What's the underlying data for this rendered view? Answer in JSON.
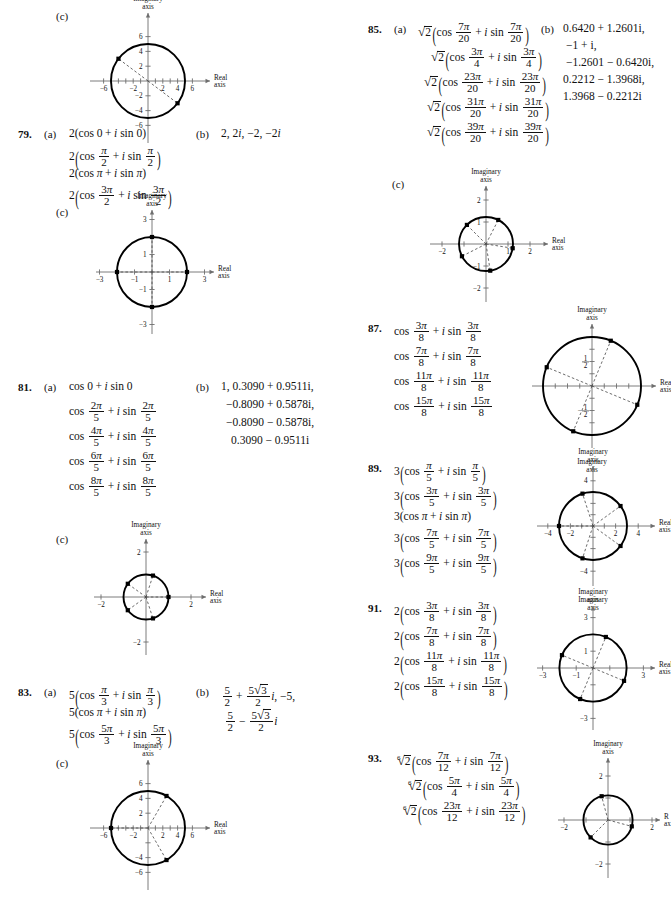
{
  "page": {
    "type": "textbook-answer-key",
    "axis_labels": {
      "imaginary": "Imaginary",
      "axis": "axis",
      "real": "Real",
      "real_clipped": "R",
      "axis_clipped": "ax"
    },
    "part_labels": {
      "a": "(a)",
      "b": "(b)",
      "c": "(c)"
    }
  },
  "problems": [
    {
      "number": "",
      "parts_c_only": true,
      "chart": {
        "id": "chart-77c",
        "radius_units": 5,
        "x_ticks": [
          -6,
          -4,
          -2,
          2,
          4,
          6
        ],
        "x_labels": [
          "-6",
          "-2",
          "2",
          "4",
          "6"
        ],
        "y_ticks": [
          -6,
          -4,
          -2,
          2,
          4,
          6
        ],
        "y_labels": [
          "6",
          "4",
          "2",
          "-2",
          "-4",
          "-6"
        ],
        "xlim": [
          -7,
          7
        ],
        "ylim": [
          -7,
          7
        ],
        "points_deg": [
          143,
          -37
        ],
        "point_r": 5
      }
    },
    {
      "number": "79.",
      "a_lines": [
        "2(cos 0 + i sin 0)",
        "2(cos pi/2 + i sin pi/2)",
        "2(cos pi + i sin pi)",
        "2(cos 3pi/2 + i sin 3pi/2)"
      ],
      "b": "2, 2i, −2, −2i",
      "chart": {
        "id": "chart-79c",
        "radius_units": 2,
        "x_ticks": [
          -3,
          -2,
          -1,
          1,
          2,
          3
        ],
        "x_labels": [
          "-3",
          "-1",
          "1",
          "3"
        ],
        "y_labels": [
          "3",
          "1",
          "-1",
          "-3"
        ],
        "xlim": [
          -3.6,
          3.6
        ],
        "ylim": [
          -3.6,
          3.6
        ],
        "points_deg": [
          0,
          90,
          180,
          270
        ],
        "point_r": 2
      }
    },
    {
      "number": "81.",
      "a_lines": [
        "cos 0 + i sin 0",
        "cos 2pi/5 + i sin 2pi/5",
        "cos 4pi/5 + i sin 4pi/5",
        "cos 6pi/5 + i sin 6pi/5",
        "cos 8pi/5 + i sin 8pi/5"
      ],
      "b_lines": [
        "1, 0.3090 + 0.9511i,",
        "−0.8090 + 0.5878i,",
        "−0.8090 − 0.5878i,",
        "0.3090 − 0.9511i"
      ],
      "chart": {
        "id": "chart-81c",
        "radius_units": 1,
        "x_labels": [
          "-2",
          "2"
        ],
        "y_labels": [
          "2",
          "-2"
        ],
        "xlim": [
          -2.6,
          2.6
        ],
        "ylim": [
          -2.6,
          2.6
        ],
        "points_deg": [
          0,
          72,
          144,
          216,
          288
        ],
        "point_r": 1
      }
    },
    {
      "number": "83.",
      "a_lines": [
        "5(cos pi/3 + i sin pi/3)",
        "5(cos pi + i sin pi)",
        "5(cos 5pi/3 + i sin 5pi/3)"
      ],
      "b_lines": [
        "5/2 + 5sqrt3/2 i, −5,",
        "5/2 − 5sqrt3/2 i"
      ],
      "chart": {
        "id": "chart-83c",
        "radius_units": 5,
        "x_labels": [
          "-6",
          "-2",
          "2",
          "4",
          "6"
        ],
        "y_labels": [
          "6",
          "4",
          "2",
          "-4",
          "-6"
        ],
        "xlim": [
          -7,
          7
        ],
        "ylim": [
          -7,
          7
        ],
        "points_deg": [
          60,
          180,
          300
        ],
        "point_r": 5
      }
    },
    {
      "number": "85.",
      "a_lines": [
        "sqrt2(cos 7pi/20 + i sin 7pi/20)",
        "sqrt2(cos 3pi/4 + i sin 3pi/4)",
        "sqrt2(cos 23pi/20 + i sin 23pi/20)",
        "sqrt2(cos 31pi/20 + i sin 31pi/20)",
        "sqrt2(cos 39pi/20 + i sin 39pi/20)"
      ],
      "b_lines": [
        "0.6420 + 1.2601i,",
        "−1 + i,",
        "−1.2601 − 0.6420i,",
        "0.2212 − 1.3968i,",
        "1.3968 − 0.2212i"
      ],
      "chart": {
        "id": "chart-85c",
        "radius_units": 1.414,
        "x_labels": [
          "-2",
          "1",
          "2"
        ],
        "y_labels": [
          "2",
          "1",
          "-1",
          "-2"
        ],
        "xlim": [
          -2.6,
          2.6
        ],
        "ylim": [
          -2.6,
          2.6
        ],
        "points_deg": [
          63,
          135,
          207,
          279,
          351
        ],
        "point_r": 1.414
      }
    },
    {
      "number": "87.",
      "a_lines": [
        "cos 3pi/8 + i sin 3pi/8",
        "cos 7pi/8 + i sin 7pi/8",
        "cos 11pi/8 + i sin 11pi/8",
        "cos 15pi/8 + i sin 15pi/8"
      ],
      "chart": {
        "id": "chart-87",
        "radius_units": 1,
        "y_labels": [
          "1/2",
          "-1/2"
        ],
        "xlim": [
          -1.35,
          1.35
        ],
        "ylim": [
          -1.35,
          1.35
        ],
        "points_deg": [
          67.5,
          157.5,
          247.5,
          337.5
        ],
        "point_r": 1,
        "bottom_label": "Imaginary"
      }
    },
    {
      "number": "89.",
      "a_lines": [
        "3(cos pi/5 + i sin pi/5)",
        "3(cos 3pi/5 + i sin 3pi/5)",
        "3(cos pi + i sin pi)",
        "3(cos 7pi/5 + i sin 7pi/5)",
        "3(cos 9pi/5 + i sin 9pi/5)"
      ],
      "chart": {
        "id": "chart-89",
        "radius_units": 3,
        "x_labels": [
          "-4",
          "-2",
          "2",
          "4"
        ],
        "y_labels": [
          "4",
          "-4"
        ],
        "xlim": [
          -4.8,
          4.8
        ],
        "ylim": [
          -4.8,
          4.8
        ],
        "points_deg": [
          36,
          108,
          180,
          252,
          324
        ],
        "point_r": 3,
        "bottom_label": "Imaginary"
      }
    },
    {
      "number": "91.",
      "a_lines": [
        "2(cos 3pi/8 + i sin 3pi/8)",
        "2(cos 7pi/8 + i sin 7pi/8)",
        "2(cos 11pi/8 + i sin 11pi/8)",
        "2(cos 15pi/8 + i sin 15pi/8)"
      ],
      "chart": {
        "id": "chart-91",
        "radius_units": 2,
        "x_labels": [
          "-3",
          "-1",
          "3"
        ],
        "y_labels": [
          "3",
          "1",
          "-3"
        ],
        "xlim": [
          -3.6,
          3.6
        ],
        "ylim": [
          -3.6,
          3.6
        ],
        "points_deg": [
          67.5,
          157.5,
          247.5,
          337.5
        ],
        "point_r": 2
      }
    },
    {
      "number": "93.",
      "a_lines": [
        "6root2(cos 7pi/12 + i sin 7pi/12)",
        "6root2(cos 5pi/4 + i sin 5pi/4)",
        "6root2(cos 23pi/12 + i sin 23pi/12)"
      ],
      "chart": {
        "id": "chart-93",
        "radius_units": 1.12,
        "x_labels": [
          "-2",
          "2"
        ],
        "y_labels": [
          "2",
          "-2"
        ],
        "xlim": [
          -2.6,
          2.6
        ],
        "ylim": [
          -2.6,
          2.6
        ],
        "points_deg": [
          105,
          225,
          345
        ],
        "point_r": 1.12
      }
    }
  ],
  "chart_data": {
    "type": "scatter",
    "xlabel": "Real axis",
    "ylabel": "Imaginary axis",
    "grid": false,
    "legend": "none",
    "plots": [
      {
        "id": "77c",
        "radius": 5,
        "angles_deg": [
          143,
          -37
        ],
        "xlim": [
          -7,
          7
        ],
        "ylim": [
          -7,
          7
        ],
        "xticks": [
          -6,
          -2,
          2,
          4,
          6
        ],
        "yticks": [
          6,
          4,
          2,
          -2,
          -4,
          -6
        ]
      },
      {
        "id": "79c",
        "radius": 2,
        "angles_deg": [
          0,
          90,
          180,
          270
        ],
        "xlim": [
          -3.6,
          3.6
        ],
        "ylim": [
          -3.6,
          3.6
        ],
        "xticks": [
          -3,
          -1,
          1,
          3
        ],
        "yticks": [
          3,
          1,
          -1,
          -3
        ]
      },
      {
        "id": "81c",
        "radius": 1,
        "angles_deg": [
          0,
          72,
          144,
          216,
          288
        ],
        "xlim": [
          -2.6,
          2.6
        ],
        "ylim": [
          -2.6,
          2.6
        ],
        "xticks": [
          -2,
          2
        ],
        "yticks": [
          2,
          -2
        ]
      },
      {
        "id": "83c",
        "radius": 5,
        "angles_deg": [
          60,
          180,
          300
        ],
        "xlim": [
          -7,
          7
        ],
        "ylim": [
          -7,
          7
        ],
        "xticks": [
          -6,
          -2,
          2,
          4,
          6
        ],
        "yticks": [
          6,
          4,
          2,
          -4,
          -6
        ]
      },
      {
        "id": "85c",
        "radius": 1.414,
        "angles_deg": [
          63,
          135,
          207,
          279,
          351
        ],
        "xlim": [
          -2.6,
          2.6
        ],
        "ylim": [
          -2.6,
          2.6
        ],
        "xticks": [
          -2,
          1,
          2
        ],
        "yticks": [
          2,
          1,
          -1,
          -2
        ]
      },
      {
        "id": "87",
        "radius": 1,
        "angles_deg": [
          67.5,
          157.5,
          247.5,
          337.5
        ],
        "xlim": [
          -1.35,
          1.35
        ],
        "ylim": [
          -1.35,
          1.35
        ],
        "xticks": [],
        "yticks": [
          "1/2",
          "-1/2"
        ]
      },
      {
        "id": "89",
        "radius": 3,
        "angles_deg": [
          36,
          108,
          180,
          252,
          324
        ],
        "xlim": [
          -4.8,
          4.8
        ],
        "ylim": [
          -4.8,
          4.8
        ],
        "xticks": [
          -4,
          -2,
          2,
          4
        ],
        "yticks": [
          4,
          -4
        ]
      },
      {
        "id": "91",
        "radius": 2,
        "angles_deg": [
          67.5,
          157.5,
          247.5,
          337.5
        ],
        "xlim": [
          -3.6,
          3.6
        ],
        "ylim": [
          -3.6,
          3.6
        ],
        "xticks": [
          -3,
          -1,
          3
        ],
        "yticks": [
          3,
          1,
          -3
        ]
      },
      {
        "id": "93",
        "radius": 1.12,
        "angles_deg": [
          105,
          225,
          345
        ],
        "xlim": [
          -2.6,
          2.6
        ],
        "ylim": [
          -2.6,
          2.6
        ],
        "xticks": [
          -2,
          2
        ],
        "yticks": [
          2,
          -2
        ]
      }
    ]
  }
}
